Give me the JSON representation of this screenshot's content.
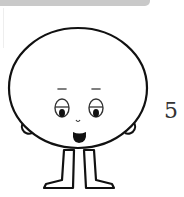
{
  "worksheet": {
    "number_label": "5",
    "character": {
      "description": "round-headed cartoon character with legs",
      "stroke_color": "#111111",
      "fill_color": "#ffffff"
    },
    "top_bar_color": "#c9c9c9"
  }
}
